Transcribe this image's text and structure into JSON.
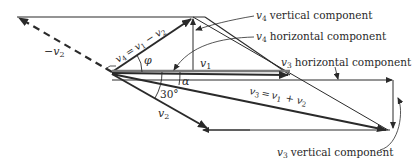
{
  "diagram": {
    "type": "vector-diagram",
    "colors": {
      "ink": "#2a2a2a",
      "background": "#ffffff"
    },
    "labels": {
      "v4_vertical": {
        "sym": "v",
        "sub": "4",
        "text": "vertical component"
      },
      "v4_horizontal": {
        "sym": "v",
        "sub": "4",
        "text": "horizontal component"
      },
      "v3_horizontal": {
        "sym": "v",
        "sub": "3",
        "text": "horizontal component"
      },
      "v3_vertical": {
        "sym": "v",
        "sub": "3",
        "text": "vertical component"
      },
      "v1": {
        "sym": "v",
        "sub": "1"
      },
      "v2": {
        "sym": "v",
        "sub": "2"
      },
      "neg_v2": {
        "prefix": "−",
        "sym": "v",
        "sub": "2"
      },
      "v4_eq": {
        "lhs_sub": "4",
        "eq": "=",
        "a_sub": "1",
        "op": "−",
        "b_sub": "2"
      },
      "v3_eq": {
        "lhs_sub": "3",
        "eq": "=",
        "a_sub": "1",
        "op": "+",
        "b_sub": "2"
      },
      "phi": "φ",
      "alpha": "α",
      "angle_30": "30°"
    }
  }
}
